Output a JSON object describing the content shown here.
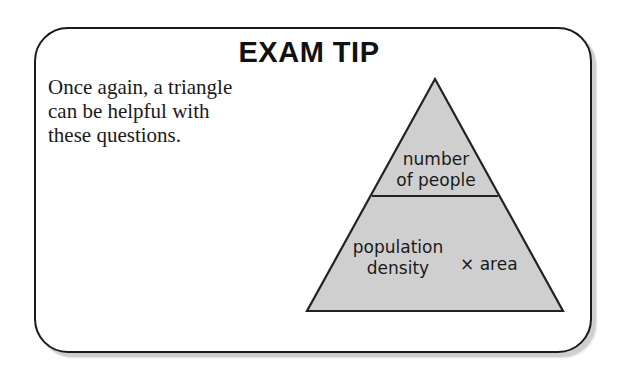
{
  "tip": {
    "title": "EXAM TIP",
    "body_lines": [
      "Once again, a triangle",
      "can be helpful with",
      "these questions."
    ]
  },
  "triangle": {
    "top_section": {
      "line1": "number",
      "line2": "of people"
    },
    "bottom_section": {
      "left_line1": "population",
      "left_line2": "density",
      "operator": "×",
      "right": "area"
    },
    "colors": {
      "fill": "#cfcfcf",
      "stroke": "#222222"
    }
  }
}
